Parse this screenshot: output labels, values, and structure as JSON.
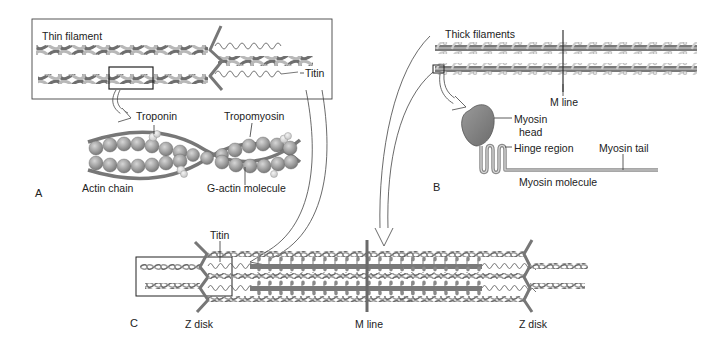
{
  "figure": {
    "panels": {
      "A": {
        "letter": "A",
        "labels": {
          "thin_filament": "Thin filament",
          "titin": "Titin",
          "troponin": "Troponin",
          "tropomyosin": "Tropomyosin",
          "actin_chain": "Actin chain",
          "g_actin": "G-actin molecule"
        }
      },
      "B": {
        "letter": "B",
        "labels": {
          "thick_filaments": "Thick filaments",
          "m_line": "M line",
          "myosin_head_1": "Myosin",
          "myosin_head_2": "head",
          "hinge_region": "Hinge region",
          "myosin_tail": "Myosin tail",
          "myosin_molecule": "Myosin molecule"
        }
      },
      "C": {
        "letter": "C",
        "labels": {
          "titin": "Titin",
          "z_disk_left": "Z disk",
          "m_line": "M line",
          "z_disk_right": "Z disk"
        }
      }
    },
    "colors": {
      "filament_dark": "#6e6e6e",
      "filament_light": "#b4b4b4",
      "thick_bar": "#777777",
      "bead": "#9c9c9c",
      "bead_highlight": "#d0d0d0",
      "troponin": "#e2e2e2",
      "outline": "#222222"
    }
  }
}
